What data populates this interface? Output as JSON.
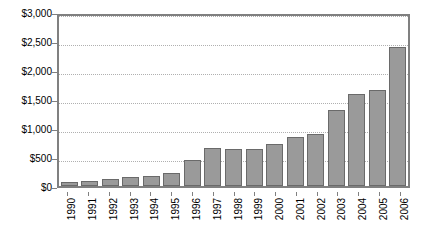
{
  "chart_data": {
    "type": "bar",
    "title": "",
    "xlabel": "",
    "ylabel": "",
    "ylim": [
      0,
      3000
    ],
    "grid": true,
    "legend": "none",
    "bar_color": "#9a9a9a",
    "bar_border_color": "#6a6a6a",
    "y_ticks": [
      "$0",
      "$500",
      "$1,000",
      "$1,500",
      "$2,000",
      "$2,500",
      "$3,000"
    ],
    "y_tick_values": [
      0,
      500,
      1000,
      1500,
      2000,
      2500,
      3000
    ],
    "categories": [
      "1990",
      "1991",
      "1992",
      "1993",
      "1994",
      "1995",
      "1996",
      "1997",
      "1998",
      "1999",
      "2000",
      "2001",
      "2002",
      "2003",
      "2004",
      "2005",
      "2006"
    ],
    "values": [
      75,
      95,
      115,
      160,
      175,
      230,
      440,
      660,
      645,
      630,
      720,
      850,
      900,
      1310,
      1580,
      1660,
      2400
    ]
  }
}
